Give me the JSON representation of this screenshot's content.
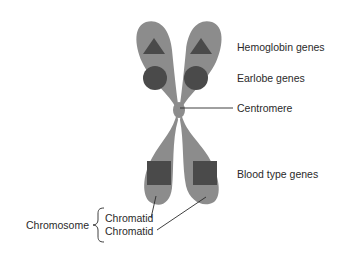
{
  "diagram": {
    "labels": {
      "hemoglobin": "Hemoglobin genes",
      "earlobe": "Earlobe genes",
      "centromere": "Centromere",
      "blood_type": "Blood type genes",
      "chromosome": "Chromosome",
      "chromatid_1": "Chromatid",
      "chromatid_2": "Chromatid"
    },
    "colors": {
      "chromosome_body": "#8c8c8c",
      "gene_marker": "#4a4a4a",
      "leader_line": "#2a2a2a",
      "text": "#2a2a2a",
      "background": "#ffffff"
    },
    "gene_markers": [
      {
        "gene": "Hemoglobin genes",
        "shape": "triangle"
      },
      {
        "gene": "Earlobe genes",
        "shape": "circle"
      },
      {
        "gene": "Blood type genes",
        "shape": "square"
      }
    ]
  }
}
